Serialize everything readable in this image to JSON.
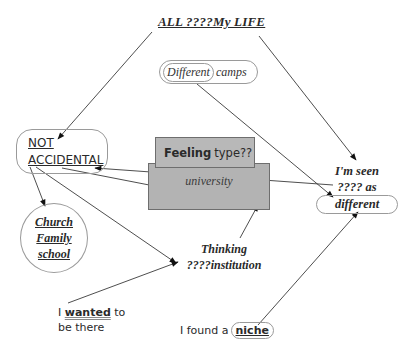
{
  "diagram": {
    "title": "ALL ????My LIFE",
    "nodes": {
      "camps": {
        "inner": "Different",
        "outer": "camps"
      },
      "not_accidental": {
        "line1": "NOT",
        "line2": "ACCIDENTAL"
      },
      "church": {
        "line1": "Church",
        "line2": "Family",
        "line3": "school"
      },
      "feeling": {
        "bold": "Feeling",
        "rest": "type??"
      },
      "university": {
        "label": "university"
      },
      "seen": {
        "line1": "I'm seen",
        "line2": "???? as",
        "line3": "different"
      },
      "thinking": {
        "line1": "Thinking",
        "line2": "????institution"
      },
      "wanted": {
        "pre": "I",
        "word": "wanted",
        "post": "to",
        "line2": "be there"
      },
      "niche": {
        "pre": "I found a",
        "word": "niche"
      }
    },
    "edges": [
      {
        "from": "title",
        "to": "not_accidental"
      },
      {
        "from": "title",
        "to": "seen"
      },
      {
        "from": "camps",
        "to": "seen"
      },
      {
        "from": "seen",
        "to": "not_accidental"
      },
      {
        "from": "not_accidental",
        "to": "university"
      },
      {
        "from": "not_accidental",
        "to": "church"
      },
      {
        "from": "not_accidental",
        "to": "thinking"
      },
      {
        "from": "wanted",
        "to": "thinking"
      },
      {
        "from": "thinking",
        "to": "university"
      },
      {
        "from": "niche",
        "to": "seen"
      }
    ],
    "colors": {
      "box_fill": "#b3b3b3",
      "box_border": "#6e6e6e",
      "outline": "#9a9a9a",
      "line": "#3a3a3a"
    }
  }
}
